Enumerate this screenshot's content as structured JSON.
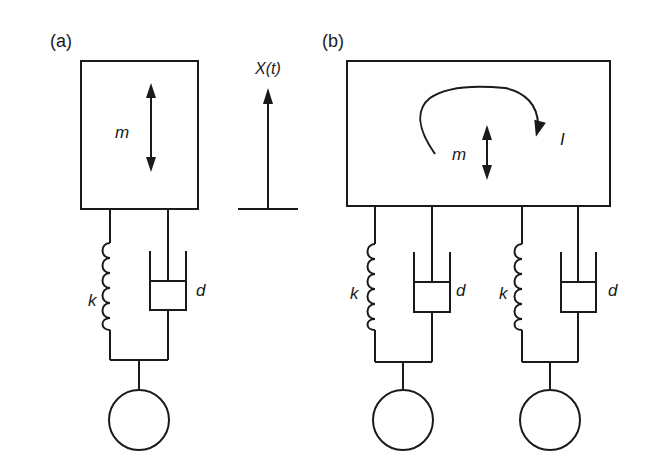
{
  "panels": {
    "a": {
      "label": "(a)",
      "mass_label": "m",
      "excitation_label": "X(t)",
      "spring_label": "k",
      "damper_label": "d"
    },
    "b": {
      "label": "(b)",
      "mass_label": "m",
      "inertia_label": "I",
      "suspensions": [
        {
          "spring_label": "k",
          "damper_label": "d"
        },
        {
          "spring_label": "k",
          "damper_label": "d"
        }
      ]
    }
  },
  "colors": {
    "stroke": "#1a1a1a",
    "background": "#ffffff"
  }
}
